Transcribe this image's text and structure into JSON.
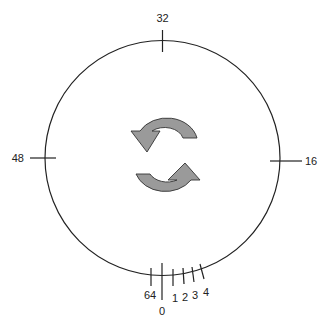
{
  "diagram": {
    "title": "",
    "dial": {
      "major_labels": {
        "top": "32",
        "right": "16",
        "bottom": "0",
        "left": "48"
      },
      "minor_labels": [
        "64",
        "1",
        "2",
        "3",
        "4"
      ]
    },
    "center_icon": "rotate-arrows-icon",
    "colors": {
      "line": "#222222",
      "arrow_fill": "#9a9a9a",
      "arrow_stroke": "#333333"
    }
  }
}
